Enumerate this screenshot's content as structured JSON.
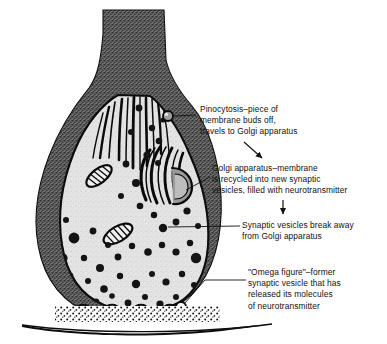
{
  "figure": {
    "background_color": "#ffffff",
    "ink_color": "#111111",
    "membrane_color": "#4a4a4a",
    "cytoplasm_color": "#d9d9d9",
    "vesicle_color": "#141414"
  },
  "callouts": [
    {
      "id": "pinocytosis",
      "text": "Pinocytosis–piece of\nmembrane buds off,\ntravels to Golgi apparatus"
    },
    {
      "id": "golgi",
      "text": "Golgi apparatus–membrane\nis recycled into new synaptic\nvesicles, filled with neurotransmitter"
    },
    {
      "id": "vesicles",
      "text": "Synaptic vesicles break away\nfrom Golgi apparatus"
    },
    {
      "id": "omega",
      "text": "\"Omega figure\"–former\nsynaptic vesicle that has\nreleased its molecules\nof neurotransmitter"
    }
  ],
  "structures": [
    {
      "name": "axon-stalk",
      "label": "Axon stalk"
    },
    {
      "name": "terminal-bouton",
      "label": "Terminal bouton"
    },
    {
      "name": "plasma-membrane",
      "label": "Plasma membrane"
    },
    {
      "name": "microtubules",
      "label": "Microtubules"
    },
    {
      "name": "golgi-apparatus",
      "label": "Golgi apparatus"
    },
    {
      "name": "mitochondrion",
      "label": "Mitochondrion"
    },
    {
      "name": "synaptic-vesicles",
      "label": "Synaptic vesicles"
    },
    {
      "name": "omega-figures",
      "label": "Omega figures"
    },
    {
      "name": "synaptic-cleft",
      "label": "Synaptic cleft"
    },
    {
      "name": "neurotransmitter-molecules",
      "label": "Neurotransmitter molecules"
    },
    {
      "name": "postsynaptic-membrane",
      "label": "Postsynaptic membrane"
    }
  ],
  "arrows": [
    {
      "id": "arrow-to-golgi-text",
      "direction": "down-right"
    },
    {
      "id": "arrow-to-vesicles-text",
      "direction": "down"
    }
  ]
}
